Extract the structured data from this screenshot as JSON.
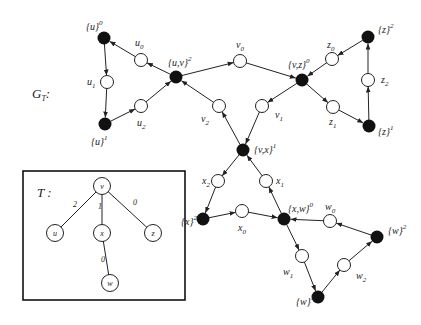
{
  "diagram": {
    "graph_label": "G",
    "graph_label_sub": "T",
    "graph_label_suffix": ":",
    "tree_label": "T :",
    "colors": {
      "black_node": "#111111",
      "white_node": "#ffffff",
      "edge": "#222222",
      "background": "#ffffff"
    },
    "black_nodes": [
      {
        "id": "u0",
        "base": "{u}",
        "sup": "0",
        "x": 104,
        "y": 38,
        "lx": 86,
        "ly": 30
      },
      {
        "id": "u1",
        "base": "{u}",
        "sup": "1",
        "x": 105,
        "y": 124,
        "lx": 91,
        "ly": 145
      },
      {
        "id": "uv2",
        "base": "{u,v}",
        "sup": "2",
        "x": 176,
        "y": 77,
        "lx": 168,
        "ly": 66
      },
      {
        "id": "vz0",
        "base": "{v,z}",
        "sup": "0",
        "x": 302,
        "y": 80,
        "lx": 288,
        "ly": 68
      },
      {
        "id": "z2",
        "base": "{z}",
        "sup": "2",
        "x": 368,
        "y": 37,
        "lx": 378,
        "ly": 33
      },
      {
        "id": "z1",
        "base": "{z}",
        "sup": "1",
        "x": 369,
        "y": 126,
        "lx": 378,
        "ly": 135
      },
      {
        "id": "vx1",
        "base": "{v,x}",
        "sup": "1",
        "x": 243,
        "y": 150,
        "lx": 254,
        "ly": 153
      },
      {
        "id": "x2",
        "base": "{x}",
        "sup": "2",
        "x": 203,
        "y": 219,
        "lx": 181,
        "ly": 225
      },
      {
        "id": "xw0",
        "base": "{x,w}",
        "sup": "0",
        "x": 284,
        "y": 219,
        "lx": 288,
        "ly": 212
      },
      {
        "id": "w2",
        "base": "{w}",
        "sup": "2",
        "x": 377,
        "y": 237,
        "lx": 388,
        "ly": 234
      },
      {
        "id": "w1",
        "base": "{w}",
        "sup": "1",
        "x": 318,
        "y": 297,
        "lx": 296,
        "ly": 305
      }
    ],
    "white_nodes": [
      {
        "id": "u_0",
        "name": "u",
        "sub": "0",
        "x": 141,
        "y": 60,
        "lx": 135,
        "ly": 46
      },
      {
        "id": "u_1",
        "name": "u",
        "sub": "1",
        "x": 107,
        "y": 82,
        "lx": 87,
        "ly": 85
      },
      {
        "id": "u_2",
        "name": "u",
        "sub": "2",
        "x": 141,
        "y": 106,
        "lx": 137,
        "ly": 126
      },
      {
        "id": "v_0",
        "name": "v",
        "sub": "0",
        "x": 240,
        "y": 61,
        "lx": 236,
        "ly": 48
      },
      {
        "id": "v_1",
        "name": "v",
        "sub": "1",
        "x": 262,
        "y": 106,
        "lx": 275,
        "ly": 118
      },
      {
        "id": "v_2",
        "name": "v",
        "sub": "2",
        "x": 219,
        "y": 106,
        "lx": 201,
        "ly": 122
      },
      {
        "id": "z_0",
        "name": "z",
        "sub": "0",
        "x": 332,
        "y": 59,
        "lx": 327,
        "ly": 48
      },
      {
        "id": "z_1",
        "name": "z",
        "sub": "1",
        "x": 333,
        "y": 107,
        "lx": 329,
        "ly": 125
      },
      {
        "id": "z_2",
        "name": "z",
        "sub": "2",
        "x": 368,
        "y": 80,
        "lx": 381,
        "ly": 83
      },
      {
        "id": "x_0",
        "name": "x",
        "sub": "0",
        "x": 242,
        "y": 211,
        "lx": 238,
        "ly": 231
      },
      {
        "id": "x_1",
        "name": "x",
        "sub": "1",
        "x": 266,
        "y": 181,
        "lx": 276,
        "ly": 184
      },
      {
        "id": "x_2",
        "name": "x",
        "sub": "2",
        "x": 218,
        "y": 181,
        "lx": 202,
        "ly": 184
      },
      {
        "id": "w_0",
        "name": "w",
        "sub": "0",
        "x": 330,
        "y": 221,
        "lx": 325,
        "ly": 210
      },
      {
        "id": "w_1",
        "name": "w",
        "sub": "1",
        "x": 302,
        "y": 256,
        "lx": 283,
        "ly": 275
      },
      {
        "id": "w_2",
        "name": "w",
        "sub": "2",
        "x": 344,
        "y": 265,
        "lx": 356,
        "ly": 279
      }
    ],
    "edges": [
      [
        "uv2",
        "u_0"
      ],
      [
        "u_0",
        "u0"
      ],
      [
        "u0",
        "u_1"
      ],
      [
        "u_1",
        "u1"
      ],
      [
        "u1",
        "u_2"
      ],
      [
        "u_2",
        "uv2"
      ],
      [
        "uv2",
        "v_0"
      ],
      [
        "v_0",
        "vz0"
      ],
      [
        "vz0",
        "v_1"
      ],
      [
        "v_1",
        "vx1"
      ],
      [
        "vx1",
        "v_2"
      ],
      [
        "v_2",
        "uv2"
      ],
      [
        "vz0",
        "z_1"
      ],
      [
        "z_1",
        "z1"
      ],
      [
        "z1",
        "z_2"
      ],
      [
        "z_2",
        "z2"
      ],
      [
        "z2",
        "z_0"
      ],
      [
        "z_0",
        "vz0"
      ],
      [
        "vx1",
        "x_2"
      ],
      [
        "x_2",
        "x2"
      ],
      [
        "x2",
        "x_0"
      ],
      [
        "x_0",
        "xw0"
      ],
      [
        "xw0",
        "x_1"
      ],
      [
        "x_1",
        "vx1"
      ],
      [
        "xw0",
        "w_1"
      ],
      [
        "w_1",
        "w1"
      ],
      [
        "w1",
        "w_2"
      ],
      [
        "w_2",
        "w2"
      ],
      [
        "w2",
        "w_0"
      ],
      [
        "w_0",
        "xw0"
      ]
    ],
    "tree": {
      "box": {
        "x": 23,
        "y": 171,
        "w": 162,
        "h": 129
      },
      "label_x": 37,
      "label_y": 197,
      "nodes": [
        {
          "id": "v",
          "label": "v",
          "x": 102,
          "y": 186
        },
        {
          "id": "u",
          "label": "u",
          "x": 55,
          "y": 233
        },
        {
          "id": "x",
          "label": "x",
          "x": 102,
          "y": 233
        },
        {
          "id": "z",
          "label": "z",
          "x": 153,
          "y": 233
        },
        {
          "id": "w",
          "label": "w",
          "x": 110,
          "y": 283
        }
      ],
      "edges": [
        {
          "from": "v",
          "to": "u",
          "weight": "2",
          "wx": 73,
          "wy": 207
        },
        {
          "from": "v",
          "to": "x",
          "weight": "1",
          "wx": 98,
          "wy": 209
        },
        {
          "from": "v",
          "to": "z",
          "weight": "0",
          "wx": 133,
          "wy": 205
        },
        {
          "from": "x",
          "to": "w",
          "weight": "0",
          "wx": 101,
          "wy": 262
        }
      ]
    }
  }
}
